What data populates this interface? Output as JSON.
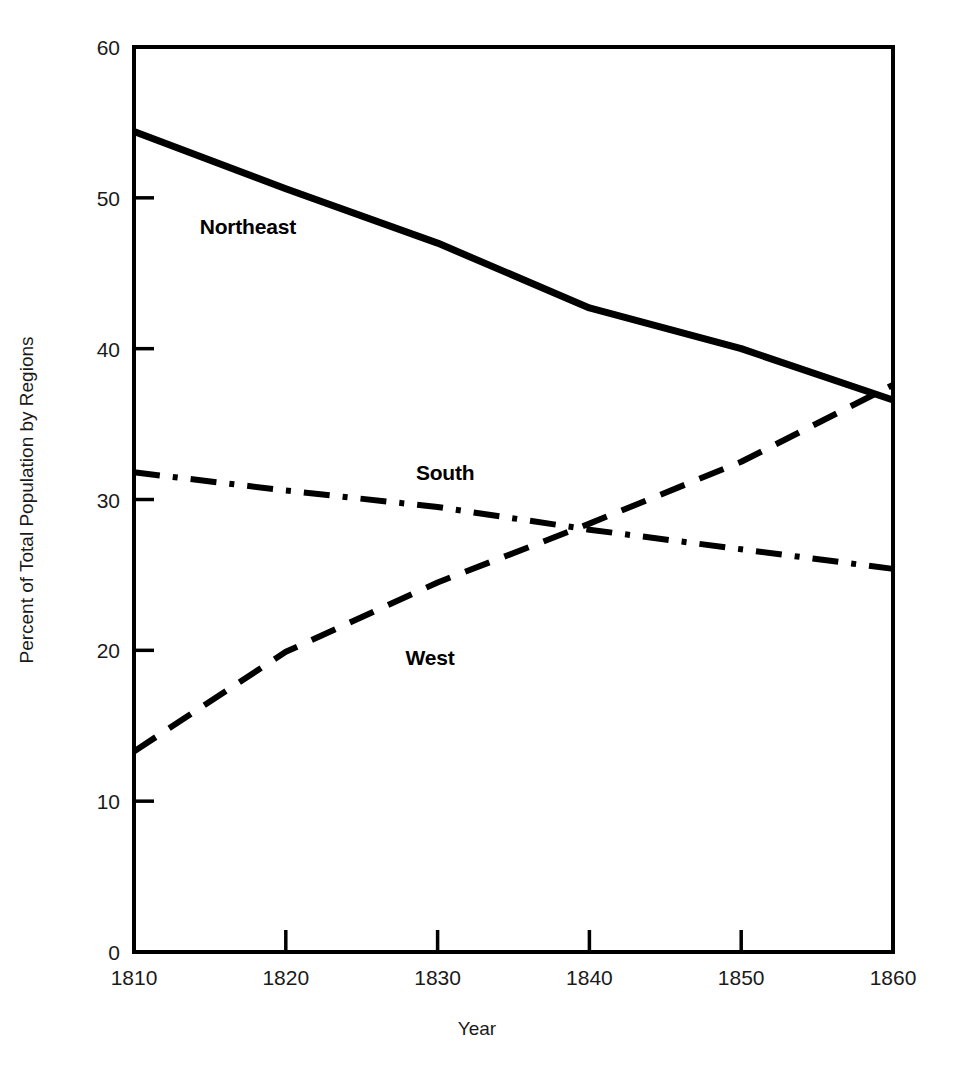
{
  "figure": {
    "background_color": "#ffffff",
    "ink_color": "#000000"
  },
  "axes": {
    "x_title": "Year",
    "y_title": "Percent of Total Population by Regions",
    "x_ticks": [
      "1810",
      "1820",
      "1830",
      "1840",
      "1850",
      "1860"
    ],
    "y_ticks": [
      "0",
      "10",
      "20",
      "30",
      "40",
      "50",
      "60"
    ]
  },
  "series_labels": {
    "northeast": "Northeast",
    "south": "South",
    "west": "West"
  },
  "chart_data": {
    "type": "line",
    "title": "",
    "subtitle": "",
    "xlabel": "Year",
    "ylabel": "Percent of Total Population by Regions",
    "xlim": [
      1810,
      1860
    ],
    "ylim": [
      0,
      60
    ],
    "xticks": [
      1810,
      1820,
      1830,
      1840,
      1850,
      1860
    ],
    "yticks": [
      0,
      10,
      20,
      30,
      40,
      50,
      60
    ],
    "grid": false,
    "legend": "inline-labels",
    "x": [
      1810,
      1820,
      1830,
      1840,
      1850,
      1860
    ],
    "series": [
      {
        "name": "Northeast",
        "linestyle": "solid",
        "color": "#000000",
        "values": [
          54.4,
          50.6,
          47.0,
          42.7,
          40.0,
          36.6
        ],
        "label_position": {
          "x": 1817.5,
          "y": 47.6
        }
      },
      {
        "name": "South",
        "linestyle": "dashdot",
        "color": "#000000",
        "values": [
          31.8,
          30.6,
          29.5,
          28.0,
          26.7,
          25.4
        ],
        "label_position": {
          "x": 1830.5,
          "y": 31.3
        }
      },
      {
        "name": "West",
        "linestyle": "dashed",
        "color": "#000000",
        "values": [
          13.3,
          19.9,
          24.5,
          28.4,
          32.5,
          37.6
        ],
        "label_position": {
          "x": 1829.5,
          "y": 19.0
        }
      }
    ],
    "annotations": [
      {
        "text": "South and West cross near 1838 at about 28 percent"
      },
      {
        "text": "Northeast and West cross near 1858 at about 37 percent"
      }
    ]
  }
}
